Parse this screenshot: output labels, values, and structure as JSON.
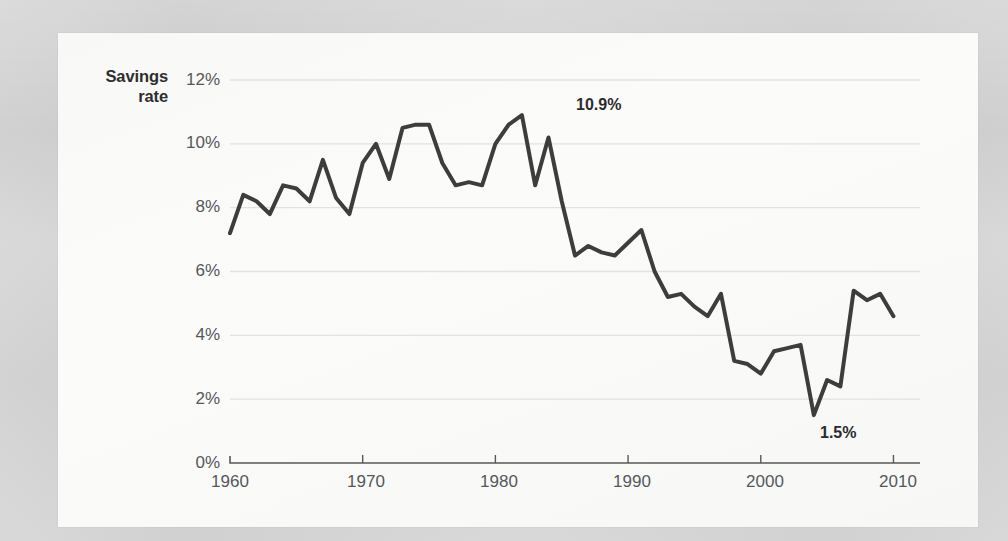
{
  "background": {
    "page_color": "#d4d4d4",
    "card_color": "#fbfbfa"
  },
  "chart_data": {
    "type": "line",
    "title": "",
    "subtitle": "",
    "xlabel": "",
    "ylabel": "Savings rate",
    "ylabel_lines": [
      "Savings",
      "rate"
    ],
    "xlim": [
      1960,
      2012
    ],
    "ylim": [
      0,
      12
    ],
    "grid": true,
    "legend": "none",
    "line_color": "#3d3d3d",
    "line_width": 4,
    "gridline_color": "#e2e2e2",
    "axis_color": "#58585a",
    "tick_label_color": "#55585a",
    "ytick_labels": [
      "12%",
      "10%",
      "8%",
      "6%",
      "4%",
      "2%",
      "0%"
    ],
    "ytick_values": [
      12,
      10,
      8,
      6,
      4,
      2,
      0
    ],
    "xtick_labels": [
      "1960",
      "1970",
      "1980",
      "1990",
      "2000",
      "2010"
    ],
    "xtick_values": [
      1960,
      1970,
      1980,
      1990,
      2000,
      2010
    ],
    "x": [
      1960,
      1961,
      1962,
      1963,
      1964,
      1965,
      1966,
      1967,
      1968,
      1969,
      1970,
      1971,
      1972,
      1973,
      1974,
      1975,
      1976,
      1977,
      1978,
      1979,
      1980,
      1981,
      1982,
      1983,
      1984,
      1985,
      1986,
      1987,
      1988,
      1989,
      1990,
      1991,
      1992,
      1993,
      1994,
      1995,
      1996,
      1997,
      1998,
      1999,
      2000,
      2001,
      2002,
      2003,
      2004,
      2005,
      2006,
      2007,
      2008,
      2009,
      2010,
      2011,
      2012
    ],
    "values": [
      7.2,
      8.4,
      8.2,
      7.8,
      8.7,
      8.6,
      8.2,
      9.5,
      8.3,
      7.8,
      10.0,
      9.6,
      8.9,
      10.6,
      10.5,
      10.6,
      10.6,
      8.7,
      8.8,
      8.7,
      10.0,
      10.9,
      8.7,
      10.2,
      8.2,
      6.5,
      6.8,
      6.7,
      6.5,
      6.9,
      7.3,
      6.0,
      5.2,
      5.3,
      4.9,
      4.6,
      5.3,
      3.2,
      3.1,
      2.8,
      3.5,
      3.6,
      3.7,
      1.5,
      2.6,
      2.4,
      5.4,
      5.1,
      5.3,
      4.6,
      4.6,
      4.6,
      4.6
    ],
    "series": [
      {
        "name": "Savings rate",
        "points": [
          {
            "year": 1960,
            "value": 7.2
          },
          {
            "year": 1961,
            "value": 8.4
          },
          {
            "year": 1962,
            "value": 8.2
          },
          {
            "year": 1963,
            "value": 7.8
          },
          {
            "year": 1964,
            "value": 8.7
          },
          {
            "year": 1965,
            "value": 8.6
          },
          {
            "year": 1966,
            "value": 8.2
          },
          {
            "year": 1967,
            "value": 9.5
          },
          {
            "year": 1968,
            "value": 8.3
          },
          {
            "year": 1969,
            "value": 7.8
          },
          {
            "year": 1970,
            "value": 9.4
          },
          {
            "year": 1971,
            "value": 10.0
          },
          {
            "year": 1972,
            "value": 8.9
          },
          {
            "year": 1973,
            "value": 10.5
          },
          {
            "year": 1974,
            "value": 10.6
          },
          {
            "year": 1975,
            "value": 10.6
          },
          {
            "year": 1976,
            "value": 9.4
          },
          {
            "year": 1977,
            "value": 8.7
          },
          {
            "year": 1978,
            "value": 8.8
          },
          {
            "year": 1979,
            "value": 8.7
          },
          {
            "year": 1980,
            "value": 10.0
          },
          {
            "year": 1981,
            "value": 10.6
          },
          {
            "year": 1982,
            "value": 10.9
          },
          {
            "year": 1983,
            "value": 8.7
          },
          {
            "year": 1984,
            "value": 10.2
          },
          {
            "year": 1985,
            "value": 8.2
          },
          {
            "year": 1986,
            "value": 6.5
          },
          {
            "year": 1987,
            "value": 6.8
          },
          {
            "year": 1988,
            "value": 6.6
          },
          {
            "year": 1989,
            "value": 6.5
          },
          {
            "year": 1990,
            "value": 6.9
          },
          {
            "year": 1991,
            "value": 7.3
          },
          {
            "year": 1992,
            "value": 6.0
          },
          {
            "year": 1993,
            "value": 5.2
          },
          {
            "year": 1994,
            "value": 5.3
          },
          {
            "year": 1995,
            "value": 4.9
          },
          {
            "year": 1996,
            "value": 4.6
          },
          {
            "year": 1997,
            "value": 5.3
          },
          {
            "year": 1998,
            "value": 3.2
          },
          {
            "year": 1999,
            "value": 3.1
          },
          {
            "year": 2000,
            "value": 2.8
          },
          {
            "year": 2001,
            "value": 3.5
          },
          {
            "year": 2002,
            "value": 3.6
          },
          {
            "year": 2003,
            "value": 3.7
          },
          {
            "year": 2004,
            "value": 1.5
          },
          {
            "year": 2005,
            "value": 2.6
          },
          {
            "year": 2006,
            "value": 2.4
          },
          {
            "year": 2007,
            "value": 5.4
          },
          {
            "year": 2008,
            "value": 5.1
          },
          {
            "year": 2009,
            "value": 5.3
          },
          {
            "year": 2010,
            "value": 4.6
          }
        ]
      }
    ],
    "annotations": [
      {
        "label": "10.9%",
        "year": 1982,
        "value": 10.9,
        "note": "peak"
      },
      {
        "label": "1.5%",
        "year": 2005,
        "value": 1.5,
        "note": "trough"
      }
    ]
  }
}
